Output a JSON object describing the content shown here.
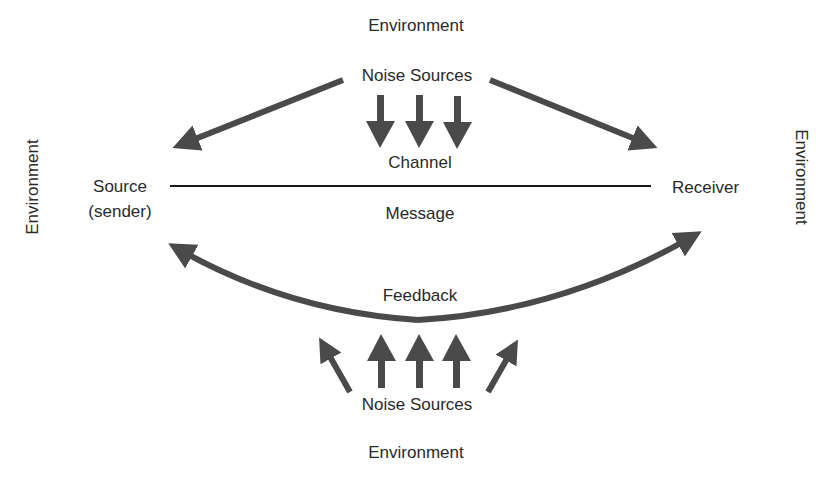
{
  "diagram": {
    "arrow_color": "#4a4a4a",
    "line_color": "#1a1a1a",
    "labels": {
      "environment_top": "Environment",
      "environment_bottom": "Environment",
      "environment_left": "Environment",
      "environment_right": "Environment",
      "noise_top": "Noise Sources",
      "noise_bottom": "Noise Sources",
      "channel": "Channel",
      "message": "Message",
      "feedback": "Feedback",
      "source_line1": "Source",
      "source_line2": "(sender)",
      "receiver": "Receiver"
    },
    "edges": [
      {
        "from": "Noise Sources (top)",
        "to": "Source (sender)"
      },
      {
        "from": "Noise Sources (top)",
        "to": "Receiver"
      },
      {
        "from": "Noise Sources (top)",
        "to": "Channel",
        "count": 3
      },
      {
        "from": "Source (sender)",
        "to": "Receiver",
        "label": "Message",
        "style": "line"
      },
      {
        "from": "Feedback",
        "to": "Source (sender)"
      },
      {
        "from": "Feedback",
        "to": "Receiver"
      },
      {
        "from": "Noise Sources (bottom)",
        "to": "Feedback",
        "count": 5
      }
    ]
  }
}
